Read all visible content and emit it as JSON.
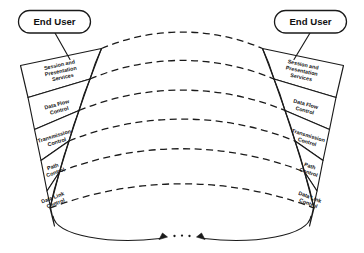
{
  "diagram": {
    "background_color": "#ffffff",
    "line_color": "#1a1a1a"
  },
  "end_users": [
    {
      "id": "left",
      "label": "End User"
    },
    {
      "id": "right",
      "label": "End User"
    }
  ],
  "layers": [
    {
      "id": "session-presentation-services",
      "index": 0,
      "lines": [
        "Session and",
        "Presentation",
        "Services"
      ]
    },
    {
      "id": "data-flow-control",
      "index": 1,
      "lines": [
        "Data Flow",
        "Control"
      ]
    },
    {
      "id": "transmission-control",
      "index": 2,
      "lines": [
        "Transmission",
        "Control"
      ]
    },
    {
      "id": "path-control",
      "index": 3,
      "lines": [
        "Path",
        "Control"
      ]
    },
    {
      "id": "data-link-control",
      "index": 4,
      "lines": [
        "Data Link",
        "Control"
      ]
    }
  ],
  "connector": {
    "id": "physical-link",
    "style": "bidirectional-arc",
    "ellipsis": "· · ·",
    "arrow_count": 2
  },
  "peer_links": {
    "style": "dashed-arc",
    "count": 6,
    "description": "Dashed peer-to-peer protocol arcs between matching layers"
  },
  "text": {
    "left_stack_label": "Left node protocol stack",
    "right_stack_label": "Right node protocol stack"
  }
}
